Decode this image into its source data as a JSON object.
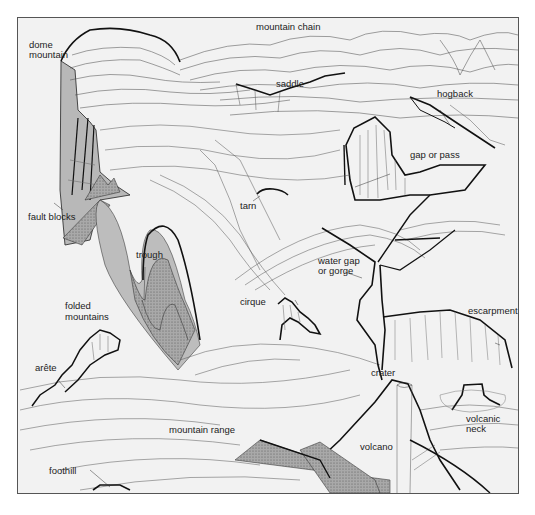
{
  "diagram": {
    "type": "illustrated landform block diagram",
    "background_color": "#f2f2f2",
    "line_color": "#222222",
    "rock_fill_colors": [
      "#bdbdbd",
      "#9e9e9e",
      "#d0d0d0"
    ],
    "labels": {
      "dome_mountain_1": "dome",
      "dome_mountain_2": "mountain",
      "mountain_chain": "mountain chain",
      "saddle": "saddle",
      "hogback": "hogback",
      "gap_or_pass": "gap or pass",
      "tarn": "tarn",
      "fault_blocks": "fault blocks",
      "trough": "trough",
      "water_gap_1": "water gap",
      "water_gap_2": "or gorge",
      "folded_mountains_1": "folded",
      "folded_mountains_2": "mountains",
      "cirque": "cirque",
      "escarpment": "escarpment",
      "arete": "arête",
      "crater": "crater",
      "volcanic_neck_1": "volcanic",
      "volcanic_neck_2": "neck",
      "mountain_range": "mountain range",
      "volcano": "volcano",
      "foothill": "foothill"
    }
  }
}
